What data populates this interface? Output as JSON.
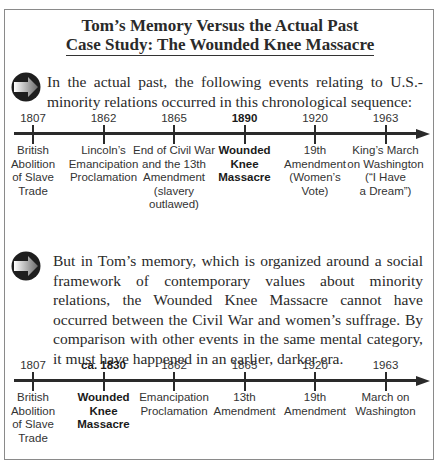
{
  "title": {
    "line1": "Tom’s Memory Versus the Actual Past",
    "line2": "Case Study: The Wounded Knee Massacre"
  },
  "section1": {
    "icon": "arrow-right-icon",
    "text": "In the actual past, the following events relating to U.S.-minority relations occurred in this chronological sequence:",
    "events": [
      {
        "year": "1807",
        "label": "British\nAbolition\nof Slave\nTrade",
        "bold": false
      },
      {
        "year": "1862",
        "label": "Lincoln’s\nEmancipation\nProclamation",
        "bold": false
      },
      {
        "year": "1865",
        "label": "End of Civil War\nand the 13th\nAmendment\n(slavery outlawed)",
        "bold": false
      },
      {
        "year": "1890",
        "label": "Wounded\nKnee\nMassacre",
        "bold": true
      },
      {
        "year": "1920",
        "label": "19th\nAmendment\n(Women’s\nVote)",
        "bold": false
      },
      {
        "year": "1963",
        "label": "King’s March\non Washington\n(“I Have\na Dream”)",
        "bold": false
      }
    ]
  },
  "section2": {
    "icon": "arrow-right-icon",
    "text": "But in Tom’s memory, which is organized around a social framework of contemporary values about minority relations, the Wounded Knee Massacre cannot have occurred between the Civil War and women’s suffrage. By comparison with other events in the same mental category, it must have happened in an earlier, darker era.",
    "events": [
      {
        "year": "1807",
        "label": "British\nAbolition\nof Slave\nTrade",
        "bold": false
      },
      {
        "year": "ca. 1830",
        "label": "Wounded\nKnee\nMassacre",
        "bold": true
      },
      {
        "year": "1862",
        "label": "Emancipation\nProclamation",
        "bold": false
      },
      {
        "year": "1865",
        "label": "13th\nAmendment",
        "bold": false
      },
      {
        "year": "1920",
        "label": "19th\nAmendment",
        "bold": false
      },
      {
        "year": "1963",
        "label": "March on\nWashington",
        "bold": false
      }
    ]
  }
}
